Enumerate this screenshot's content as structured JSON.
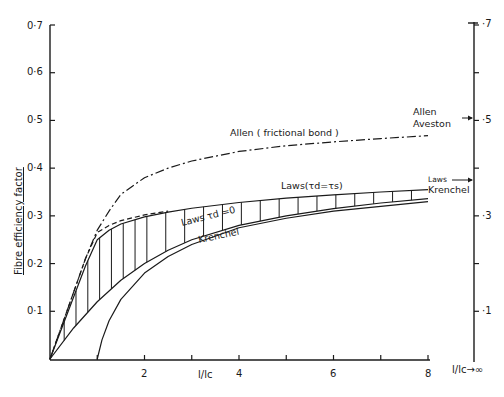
{
  "chart_data": {
    "type": "line",
    "title": "",
    "data_provenance": {
      "read_from_figure": [
        "axes",
        "xlim",
        "ylim",
        "tick labels",
        "axis titles",
        "annotation text",
        "label positions"
      ],
      "approximated": [
        "series.*.x",
        "series.*.y"
      ],
      "note": "Series coordinates are NOT extracted data. They are hand-estimated by visually tracing the curves and smoothly interpolating between eyeballed anchor points. Treat them as approximate shapes for redrawing, not as measured values."
    },
    "xlabel": "l/lc",
    "ylabel": "Fibre efficiency factor",
    "xlim": [
      0,
      8
    ],
    "ylim": [
      0,
      0.7
    ],
    "grid": false,
    "x_ticks": [
      1,
      2,
      3,
      4,
      5,
      6,
      7,
      8
    ],
    "x_tick_labels": [
      "",
      "2",
      "",
      "4",
      "",
      "6",
      "",
      "8"
    ],
    "y_ticks": [
      0.1,
      0.2,
      0.3,
      0.4,
      0.5,
      0.6,
      0.7
    ],
    "y_tick_labels": [
      "0·1",
      "0·2",
      "0·3",
      "0·4",
      "0·5",
      "0·6",
      "0·7"
    ],
    "right_axis": {
      "label": "l/lc→∞",
      "ticks": [
        0.1,
        0.2,
        0.3,
        0.4,
        0.5,
        0.6,
        0.7
      ],
      "tick_labels": [
        "·1",
        "",
        "·3",
        "",
        "·5",
        "",
        "·7"
      ]
    },
    "series": [
      {
        "name": "Allen (frictional bond)",
        "style": "dash-dot",
        "x": [
          0,
          0.25,
          0.5,
          0.75,
          1.0,
          1.25,
          1.5,
          2.0,
          2.5,
          3.0,
          4.0,
          5.0,
          6.0,
          7.0,
          8.0
        ],
        "y": [
          0,
          0.07,
          0.14,
          0.21,
          0.27,
          0.31,
          0.345,
          0.38,
          0.4,
          0.415,
          0.435,
          0.447,
          0.455,
          0.462,
          0.468
        ]
      },
      {
        "name": "Laws (τd = τs)",
        "style": "solid",
        "x": [
          0,
          0.25,
          0.5,
          0.75,
          1.0,
          1.25,
          1.5,
          2.0,
          2.5,
          3.0,
          4.0,
          5.0,
          6.0,
          7.0,
          8.0
        ],
        "y": [
          0,
          0.065,
          0.13,
          0.195,
          0.25,
          0.27,
          0.283,
          0.298,
          0.308,
          0.316,
          0.328,
          0.337,
          0.344,
          0.35,
          0.355
        ]
      },
      {
        "name": "Laws τd = 0",
        "style": "dashed",
        "x": [
          0,
          0.25,
          0.5,
          0.75,
          1.0,
          1.25,
          1.5,
          1.75,
          2.0,
          2.25,
          2.5
        ],
        "y": [
          0,
          0.07,
          0.14,
          0.21,
          0.265,
          0.28,
          0.29,
          0.296,
          0.302,
          0.306,
          0.31
        ]
      },
      {
        "name": "Laws lower bound",
        "style": "solid",
        "x": [
          0,
          0.5,
          1.0,
          1.5,
          2.0,
          2.5,
          3.0,
          4.0,
          5.0,
          6.0,
          7.0,
          8.0
        ],
        "y": [
          0,
          0.065,
          0.12,
          0.165,
          0.2,
          0.228,
          0.25,
          0.28,
          0.3,
          0.315,
          0.327,
          0.336
        ]
      },
      {
        "name": "Krenchel",
        "style": "solid",
        "x": [
          1.0,
          1.1,
          1.25,
          1.5,
          2.0,
          2.5,
          3.0,
          4.0,
          5.0,
          6.0,
          7.0,
          8.0
        ],
        "y": [
          0,
          0.04,
          0.08,
          0.125,
          0.18,
          0.215,
          0.24,
          0.275,
          0.295,
          0.31,
          0.32,
          0.33
        ]
      }
    ],
    "annotations": [
      {
        "text": "Allen ( frictional bond )",
        "x": 3.9,
        "y": 0.425
      },
      {
        "text": "Laws(τd=τs)",
        "x": 4.8,
        "y": 0.345
      },
      {
        "text": "Laws τd =0",
        "x": 2.8,
        "y": 0.305
      },
      {
        "text": "Krenchel",
        "x": 3.1,
        "y": 0.255
      },
      {
        "text": "Allen",
        "x": 8.1,
        "y": 0.52
      },
      {
        "text": "Aveston",
        "x": 8.1,
        "y": 0.495
      },
      {
        "text": "Laws",
        "x": 8.05,
        "y": 0.38
      },
      {
        "text": "Krenchel",
        "x": 8.05,
        "y": 0.36
      }
    ],
    "right_axis_markers": [
      {
        "label": "Allen Aveston",
        "y": 0.5
      },
      {
        "label": "Laws Krenchel",
        "y": 0.375
      }
    ]
  },
  "labels": {
    "ylabel": "Fibre efficiency factor",
    "xlabel": "l/lc",
    "right_axis_label": "l/lc→∞",
    "y_ticks": [
      "0·1",
      "0·2",
      "0·3",
      "0·4",
      "0·5",
      "0·6",
      "0·7"
    ],
    "x_ticks": [
      "2",
      "4",
      "6",
      "8"
    ],
    "right_ticks": [
      "·1",
      "·3",
      "·5",
      "·7"
    ],
    "allen_frictional": "Allen ( frictional bond )",
    "laws_eq": "Laws(τd=τs)",
    "laws_zero": "Laws τd =0",
    "krenchel": "Krenchel",
    "allen": "Allen",
    "aveston": "Aveston",
    "laws_right": "Laws",
    "krenchel_right": "Krenchel"
  }
}
